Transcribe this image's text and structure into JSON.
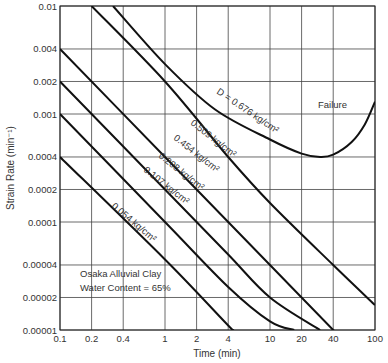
{
  "chart_data": {
    "type": "line",
    "title": "",
    "xlabel": "Time (min)",
    "ylabel": "Strain Rate (min⁻¹)",
    "xscale": "log",
    "yscale": "log",
    "xlim": [
      0.1,
      100
    ],
    "ylim": [
      1e-05,
      0.01
    ],
    "grid": true,
    "x_ticks": [
      "0.1",
      "0.2",
      "0.4",
      "1",
      "2",
      "4",
      "10",
      "20",
      "40",
      "100"
    ],
    "y_ticks": [
      "0.01",
      "0.004",
      "0.002",
      "0.001",
      "0.0004",
      "0.0002",
      "0.0001",
      "0.00004",
      "0.00002",
      "0.00001"
    ],
    "annotations": {
      "material": "Osaka Alluvial Clay",
      "water_content": "Water Content = 65%",
      "failure": "Failure"
    },
    "series": [
      {
        "name": "D = 0.676 kg/cm²",
        "label": "D = 0.676 kg/cm²",
        "points": [
          [
            0.32,
            0.01
          ],
          [
            1,
            0.0029
          ],
          [
            3,
            0.0011
          ],
          [
            10,
            0.00058
          ],
          [
            20,
            0.00043
          ],
          [
            30,
            0.0004
          ],
          [
            40,
            0.00042
          ],
          [
            60,
            0.00055
          ],
          [
            80,
            0.0008
          ],
          [
            100,
            0.0013
          ]
        ]
      },
      {
        "name": "0.509 kg/cm²",
        "label": "0.509 kg/cm²",
        "points": [
          [
            0.2,
            0.01
          ],
          [
            1,
            0.002
          ],
          [
            4,
            0.0004
          ],
          [
            10,
            0.00015
          ],
          [
            40,
            4e-05
          ],
          [
            100,
            1.7e-05
          ]
        ]
      },
      {
        "name": "0.454 kg/cm²",
        "label": "0.454 kg/cm²",
        "points": [
          [
            0.1,
            0.004
          ],
          [
            1,
            0.0004
          ],
          [
            4,
            0.0001
          ],
          [
            10,
            4e-05
          ],
          [
            40,
            1e-05
          ],
          [
            50,
            8e-06
          ]
        ]
      },
      {
        "name": "0.208 kg/cm²",
        "label": "0.208 kg/cm²",
        "points": [
          [
            0.1,
            0.002
          ],
          [
            1,
            0.0002
          ],
          [
            4,
            5e-05
          ],
          [
            10,
            2e-05
          ],
          [
            30,
            1e-05
          ]
        ]
      },
      {
        "name": "0.107 kg/cm²",
        "label": "0.107 kg/cm²",
        "points": [
          [
            0.1,
            0.001
          ],
          [
            1,
            0.0001
          ],
          [
            4,
            2.5e-05
          ],
          [
            10,
            1.2e-05
          ],
          [
            17,
            1e-05
          ]
        ]
      },
      {
        "name": "0.054 kg/cm²",
        "label": "0.054 kg/cm²",
        "points": [
          [
            0.1,
            0.0004
          ],
          [
            1,
            4.5e-05
          ],
          [
            4,
            1.1e-05
          ],
          [
            4.5,
            1e-05
          ]
        ]
      }
    ]
  }
}
